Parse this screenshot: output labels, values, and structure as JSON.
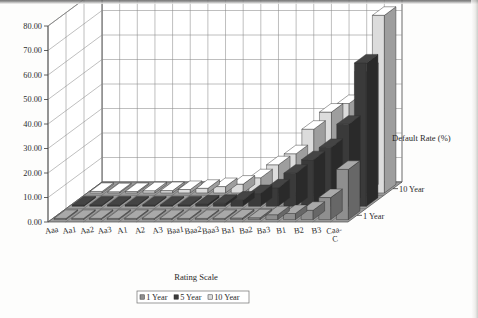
{
  "chart_data": {
    "type": "bar",
    "title": "",
    "subtitle": "",
    "xlabel": "Rating Scale",
    "ylabel": "Default Rate (%)",
    "zlabel": "",
    "ylim": [
      0,
      80
    ],
    "ytick_labels": [
      "0.00",
      "10.00",
      "20.00",
      "30.00",
      "40.00",
      "50.00",
      "60.00",
      "70.00",
      "80.00"
    ],
    "ytick_values": [
      0,
      10,
      20,
      30,
      40,
      50,
      60,
      70,
      80
    ],
    "grid": true,
    "projection": "3d",
    "legend_position": "bottom-center",
    "depth_axis_labels": [
      "1 Year",
      "10 Year"
    ],
    "categories": [
      "Aaa",
      "Aa1",
      "Aa2",
      "Aa3",
      "A1",
      "A2",
      "A3",
      "Baa1",
      "Baa2",
      "Baa3",
      "Ba1",
      "Ba2",
      "Ba3",
      "B1",
      "B2",
      "B3",
      "Caa-C"
    ],
    "series": [
      {
        "name": "1 Year",
        "color": "#8f8f8f",
        "values": [
          0.0,
          0.0,
          0.0,
          0.05,
          0.0,
          0.05,
          0.05,
          0.15,
          0.15,
          0.35,
          0.65,
          0.75,
          2.0,
          2.5,
          3.8,
          9.0,
          20.5
        ]
      },
      {
        "name": "5 Year",
        "color": "#3a3a3a",
        "values": [
          0.1,
          0.1,
          0.15,
          0.25,
          0.25,
          0.4,
          0.55,
          0.9,
          1.2,
          2.5,
          5.2,
          7.5,
          13.5,
          19.0,
          24.0,
          33.5,
          58.5
        ]
      },
      {
        "name": "10 Year",
        "color": "#dcdcdc",
        "values": [
          0.6,
          0.5,
          0.55,
          0.9,
          0.95,
          1.4,
          1.9,
          2.6,
          3.6,
          6.2,
          11.5,
          16.0,
          26.0,
          33.0,
          36.5,
          49.5,
          72.5
        ]
      }
    ]
  },
  "legend": {
    "items": [
      {
        "label": "1 Year",
        "color": "#8f8f8f"
      },
      {
        "label": "5 Year",
        "color": "#3a3a3a"
      },
      {
        "label": "10 Year",
        "color": "#dcdcdc"
      }
    ]
  },
  "axes": {
    "y_title": "Default Rate (%)",
    "x_title": "Rating Scale",
    "z_front": "1 Year",
    "z_back": "10 Year"
  }
}
